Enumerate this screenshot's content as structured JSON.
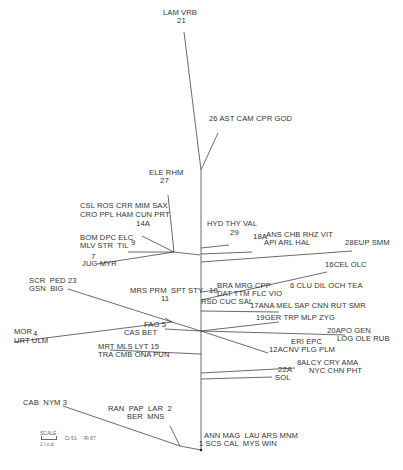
{
  "diagram": {
    "type": "phylogenetic-tree",
    "line_color": "#444444",
    "root": {
      "x": 201,
      "y": 170
    },
    "edges": [
      {
        "x1": 184,
        "y1": 32,
        "x2": 201,
        "y2": 170
      },
      {
        "x1": 218,
        "y1": 133,
        "x2": 201,
        "y2": 170
      },
      {
        "x1": 201,
        "y1": 170,
        "x2": 201,
        "y2": 450
      },
      {
        "x1": 200,
        "y1": 255,
        "x2": 174,
        "y2": 252
      },
      {
        "x1": 174,
        "y1": 252,
        "x2": 168,
        "y2": 195
      },
      {
        "x1": 174,
        "y1": 252,
        "x2": 142,
        "y2": 236
      },
      {
        "x1": 174,
        "y1": 252,
        "x2": 128,
        "y2": 252
      },
      {
        "x1": 174,
        "y1": 252,
        "x2": 97,
        "y2": 264
      },
      {
        "x1": 201,
        "y1": 248,
        "x2": 229,
        "y2": 245
      },
      {
        "x1": 201,
        "y1": 254,
        "x2": 252,
        "y2": 252
      },
      {
        "x1": 201,
        "y1": 262,
        "x2": 352,
        "y2": 251
      },
      {
        "x1": 201,
        "y1": 292,
        "x2": 217,
        "y2": 290
      },
      {
        "x1": 201,
        "y1": 300,
        "x2": 327,
        "y2": 272
      },
      {
        "x1": 201,
        "y1": 311,
        "x2": 279,
        "y2": 312
      },
      {
        "x1": 201,
        "y1": 331,
        "x2": 279,
        "y2": 322
      },
      {
        "x1": 201,
        "y1": 331,
        "x2": 345,
        "y2": 335
      },
      {
        "x1": 201,
        "y1": 331,
        "x2": 268,
        "y2": 353
      },
      {
        "x1": 201,
        "y1": 331,
        "x2": 172,
        "y2": 322
      },
      {
        "x1": 172,
        "y1": 322,
        "x2": 165,
        "y2": 318
      },
      {
        "x1": 172,
        "y1": 322,
        "x2": 68,
        "y2": 289
      },
      {
        "x1": 172,
        "y1": 322,
        "x2": 14,
        "y2": 342
      },
      {
        "x1": 201,
        "y1": 331,
        "x2": 165,
        "y2": 329
      },
      {
        "x1": 201,
        "y1": 332,
        "x2": 201,
        "y2": 332
      },
      {
        "x1": 201,
        "y1": 354,
        "x2": 110,
        "y2": 350
      },
      {
        "x1": 201,
        "y1": 373,
        "x2": 295,
        "y2": 368
      },
      {
        "x1": 201,
        "y1": 379,
        "x2": 272,
        "y2": 377
      },
      {
        "x1": 201,
        "y1": 450,
        "x2": 180,
        "y2": 446
      },
      {
        "x1": 180,
        "y1": 446,
        "x2": 170,
        "y2": 426
      },
      {
        "x1": 180,
        "y1": 446,
        "x2": 63,
        "y2": 406
      }
    ],
    "labels": [
      {
        "id": "21",
        "text": "LAM VRB",
        "x": 163,
        "y": 16
      },
      {
        "id": "21-num",
        "text": "21",
        "x": 177,
        "y": 24,
        "num": true
      },
      {
        "id": "26",
        "text": "26 AST CAM CPR GOD",
        "x": 209,
        "y": 122
      },
      {
        "id": "27",
        "text": "ELE RHM",
        "x": 149,
        "y": 176
      },
      {
        "id": "27-num",
        "text": "27",
        "x": 160,
        "y": 184,
        "num": true
      },
      {
        "id": "14A-1",
        "text": "CSL ROS CRR MIM SAX",
        "x": 80,
        "y": 209
      },
      {
        "id": "14A-2",
        "text": "CRO PPL HAM CUN PRT",
        "x": 80,
        "y": 218
      },
      {
        "id": "14A-num",
        "text": "14A",
        "x": 136,
        "y": 227,
        "num": true
      },
      {
        "id": "9-1",
        "text": "BOM DPC ELC",
        "x": 80,
        "y": 241
      },
      {
        "id": "9-2",
        "text": "MLV STR  TIL",
        "x": 80,
        "y": 249
      },
      {
        "id": "9-num",
        "text": "9",
        "x": 131,
        "y": 246,
        "num": true
      },
      {
        "id": "7-num",
        "text": "7",
        "x": 91,
        "y": 260,
        "num": true
      },
      {
        "id": "7",
        "text": "JUG MYR",
        "x": 82,
        "y": 267
      },
      {
        "id": "29-1",
        "text": "HYD THY VAL",
        "x": 207,
        "y": 227
      },
      {
        "id": "29-num",
        "text": "29",
        "x": 230,
        "y": 236,
        "num": true
      },
      {
        "id": "18A-num",
        "text": "18A",
        "x": 253,
        "y": 240,
        "num": true
      },
      {
        "id": "18A-1",
        "text": "ANS CHB RHZ VIT",
        "x": 266,
        "y": 238
      },
      {
        "id": "18A-2",
        "text": "API ARL HAL",
        "x": 264,
        "y": 246
      },
      {
        "id": "28",
        "text": "28EUP SMM",
        "x": 345,
        "y": 246
      },
      {
        "id": "16",
        "text": "16CEL OLC",
        "x": 325,
        "y": 268
      },
      {
        "id": "23-1",
        "text": "SCR  PED 23",
        "x": 29,
        "y": 284
      },
      {
        "id": "23-2",
        "text": "GSN  BIG",
        "x": 29,
        "y": 292
      },
      {
        "id": "11-1",
        "text": "MRS PRM  SPT STY",
        "x": 130,
        "y": 294
      },
      {
        "id": "11-num",
        "text": "11",
        "x": 161,
        "y": 302,
        "num": true
      },
      {
        "id": "10-num",
        "text": "10",
        "x": 209,
        "y": 294,
        "num": true
      },
      {
        "id": "10-1",
        "text": "BRA MRG CPP",
        "x": 217,
        "y": 289
      },
      {
        "id": "10-2",
        "text": "DAT TTM FLC VIO",
        "x": 217,
        "y": 297
      },
      {
        "id": "10-3",
        "text": "RSD CUC SAL",
        "x": 201,
        "y": 305
      },
      {
        "id": "6",
        "text": "6 CLU DIL OCH TEA",
        "x": 290,
        "y": 289
      },
      {
        "id": "17",
        "text": "17ANA MEL SAP CNN RUT SMR",
        "x": 250,
        "y": 309
      },
      {
        "id": "19",
        "text": "19GER TRP MLP ZYG",
        "x": 256,
        "y": 321
      },
      {
        "id": "5-1",
        "text": "FAG 5",
        "x": 144,
        "y": 328
      },
      {
        "id": "5-2",
        "text": "CAS BET",
        "x": 124,
        "y": 336
      },
      {
        "id": "20-1",
        "text": "20APO GEN",
        "x": 327,
        "y": 334
      },
      {
        "id": "20-2",
        "text": "LOG OLE RUB",
        "x": 337,
        "y": 342
      },
      {
        "id": "4-1",
        "text": "MOR",
        "x": 14,
        "y": 335
      },
      {
        "id": "4-num",
        "text": "4",
        "x": 33,
        "y": 337,
        "num": true
      },
      {
        "id": "4-2",
        "text": "URT ULM",
        "x": 14,
        "y": 344
      },
      {
        "id": "12A-1",
        "text": "ERI EPC",
        "x": 291,
        "y": 345
      },
      {
        "id": "12A-2",
        "text": "12ACNV PLG PLM",
        "x": 269,
        "y": 353
      },
      {
        "id": "15-1",
        "text": "MRT MLS LYT 15",
        "x": 98,
        "y": 350
      },
      {
        "id": "15-2",
        "text": "TRA CMB ONA PUN",
        "x": 98,
        "y": 358
      },
      {
        "id": "8A-1",
        "text": "8ALCY CRY AMA",
        "x": 297,
        "y": 366
      },
      {
        "id": "8A-2",
        "text": "NYC CHN PHT",
        "x": 309,
        "y": 374
      },
      {
        "id": "22A-num",
        "text": "22A",
        "x": 278,
        "y": 373,
        "num": true
      },
      {
        "id": "22A",
        "text": "SOL",
        "x": 275,
        "y": 381
      },
      {
        "id": "3",
        "text": "CAB  NYM 3",
        "x": 23,
        "y": 406
      },
      {
        "id": "2-1",
        "text": "RAN  PAP  LAR  2",
        "x": 108,
        "y": 412
      },
      {
        "id": "2-2",
        "text": "BER  MNS",
        "x": 127,
        "y": 420
      },
      {
        "id": "1-1",
        "text": "ANN MAG  LAU ARS MNM",
        "x": 204,
        "y": 439
      },
      {
        "id": "1-2",
        "text": "1 SCS CAL  MYS WIN",
        "x": 199,
        "y": 447
      }
    ],
    "scale": {
      "label": "SCALE",
      "unit": "1 i.n.d.",
      "ci": "Ci 91",
      "ri": "Ri 87"
    }
  }
}
